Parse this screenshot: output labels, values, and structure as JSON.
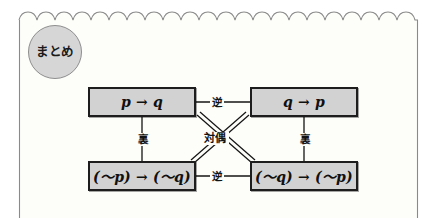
{
  "page": {
    "background_color": "#ffffff",
    "paper_color": "#fdfdfa",
    "paper_border_color": "#8a8a8a"
  },
  "badge": {
    "label": "まとめ",
    "fill_color": "#d6d6d6",
    "border_color": "#8e8e8e",
    "icon": "summary-circle-badge"
  },
  "diagram": {
    "box_fill_color": "#d2d2d2",
    "box_border_color": "#1d1d1d",
    "boxes": [
      {
        "id": "pq",
        "label": "p → q",
        "position": "top-left"
      },
      {
        "id": "qp",
        "label": "q → p",
        "position": "top-right"
      },
      {
        "id": "npnq",
        "label": "(～p) → (～q)",
        "position": "bottom-left"
      },
      {
        "id": "nqnp",
        "label": "(～q) → (～p)",
        "position": "bottom-right"
      }
    ],
    "edges": [
      {
        "id": "gyaku-top",
        "label": "逆",
        "kind": "converse",
        "from": "pq",
        "to": "qp",
        "style": "single-line-horizontal"
      },
      {
        "id": "gyaku-bottom",
        "label": "逆",
        "kind": "converse",
        "from": "npnq",
        "to": "nqnp",
        "style": "single-line-horizontal"
      },
      {
        "id": "ura-left",
        "label": "裏",
        "kind": "inverse",
        "from": "pq",
        "to": "npnq",
        "style": "single-line-vertical"
      },
      {
        "id": "ura-right",
        "label": "裏",
        "kind": "inverse",
        "from": "qp",
        "to": "nqnp",
        "style": "single-line-vertical"
      },
      {
        "id": "taigu",
        "label": "対偶",
        "kind": "contrapositive",
        "from": "pq",
        "to": "nqnp",
        "style": "double-line-diagonal"
      },
      {
        "id": "taigu-2",
        "label": "対偶",
        "kind": "contrapositive",
        "from": "qp",
        "to": "npnq",
        "style": "double-line-diagonal"
      }
    ]
  }
}
